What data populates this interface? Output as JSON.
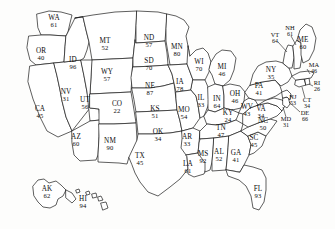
{
  "map": {
    "title": "United States choropleth value map",
    "stroke_color": "#1a1a1a",
    "fill_color": "#ffffff",
    "background_color": "#fdfdfc"
  },
  "chart_data": {
    "type": "map",
    "title": "",
    "xlabel": "",
    "ylabel": "",
    "categories": [
      "WA",
      "OR",
      "CA",
      "NV",
      "ID",
      "MT",
      "WY",
      "UT",
      "AZ",
      "CO",
      "NM",
      "ND",
      "SD",
      "NE",
      "KS",
      "OK",
      "TX",
      "MN",
      "IA",
      "MO",
      "AR",
      "LA",
      "WI",
      "IL",
      "MI",
      "IN",
      "OH",
      "KY",
      "TN",
      "MS",
      "AL",
      "GA",
      "FL",
      "SC",
      "NC",
      "VA",
      "WV",
      "MD",
      "DE",
      "PA",
      "NJ",
      "NY",
      "CT",
      "RI",
      "MA",
      "VT",
      "NH",
      "ME",
      "AK",
      "HI"
    ],
    "values": [
      61,
      40,
      45,
      31,
      96,
      52,
      57,
      56,
      60,
      22,
      90,
      57,
      70,
      87,
      51,
      34,
      45,
      80,
      78,
      54,
      33,
      61,
      70,
      33,
      46,
      64,
      46,
      24,
      47,
      92,
      52,
      41,
      93,
      45,
      50,
      34,
      43,
      31,
      66,
      41,
      53,
      35,
      34,
      26,
      46,
      64,
      61,
      60,
      62,
      94
    ]
  },
  "states": [
    {
      "abbr": "WA",
      "value": "61",
      "x": 54,
      "y": 22,
      "size": "normal"
    },
    {
      "abbr": "OR",
      "value": "40",
      "x": 41,
      "y": 55,
      "size": "normal"
    },
    {
      "abbr": "CA",
      "value": "45",
      "x": 40,
      "y": 113,
      "size": "normal"
    },
    {
      "abbr": "NV",
      "value": "31",
      "x": 66,
      "y": 96,
      "size": "normal"
    },
    {
      "abbr": "ID",
      "value": "96",
      "x": 73,
      "y": 64,
      "size": "normal"
    },
    {
      "abbr": "MT",
      "value": "52",
      "x": 105,
      "y": 45,
      "size": "normal"
    },
    {
      "abbr": "WY",
      "value": "57",
      "x": 107,
      "y": 76,
      "size": "normal"
    },
    {
      "abbr": "UT",
      "value": "56",
      "x": 85,
      "y": 104,
      "size": "normal"
    },
    {
      "abbr": "AZ",
      "value": "60",
      "x": 76,
      "y": 141,
      "size": "normal"
    },
    {
      "abbr": "CO",
      "value": "22",
      "x": 117,
      "y": 108,
      "size": "normal"
    },
    {
      "abbr": "NM",
      "value": "90",
      "x": 110,
      "y": 145,
      "size": "normal"
    },
    {
      "abbr": "ND",
      "value": "57",
      "x": 149,
      "y": 42,
      "size": "normal"
    },
    {
      "abbr": "SD",
      "value": "70",
      "x": 149,
      "y": 65,
      "size": "normal"
    },
    {
      "abbr": "NE",
      "value": "87",
      "x": 150,
      "y": 90,
      "size": "normal"
    },
    {
      "abbr": "KS",
      "value": "51",
      "x": 155,
      "y": 113,
      "size": "normal"
    },
    {
      "abbr": "OK",
      "value": "34",
      "x": 158,
      "y": 136,
      "size": "normal"
    },
    {
      "abbr": "TX",
      "value": "45",
      "x": 140,
      "y": 160,
      "size": "normal"
    },
    {
      "abbr": "MN",
      "value": "80",
      "x": 177,
      "y": 51,
      "size": "normal"
    },
    {
      "abbr": "IA",
      "value": "78",
      "x": 180,
      "y": 86,
      "size": "normal"
    },
    {
      "abbr": "MO",
      "value": "54",
      "x": 184,
      "y": 114,
      "size": "normal"
    },
    {
      "abbr": "AR",
      "value": "33",
      "x": 187,
      "y": 141,
      "size": "normal"
    },
    {
      "abbr": "LA",
      "value": "61",
      "x": 188,
      "y": 168,
      "size": "normal"
    },
    {
      "abbr": "WI",
      "value": "70",
      "x": 199,
      "y": 66,
      "size": "normal"
    },
    {
      "abbr": "IL",
      "value": "33",
      "x": 201,
      "y": 102,
      "size": "normal"
    },
    {
      "abbr": "MI",
      "value": "46",
      "x": 222,
      "y": 71,
      "size": "normal"
    },
    {
      "abbr": "IN",
      "value": "64",
      "x": 217,
      "y": 103,
      "size": "normal"
    },
    {
      "abbr": "OH",
      "value": "46",
      "x": 235,
      "y": 98,
      "size": "normal"
    },
    {
      "abbr": "KY",
      "value": "24",
      "x": 228,
      "y": 117,
      "size": "normal"
    },
    {
      "abbr": "TN",
      "value": "47",
      "x": 221,
      "y": 132,
      "size": "normal"
    },
    {
      "abbr": "MS",
      "value": "92",
      "x": 203,
      "y": 158,
      "size": "normal"
    },
    {
      "abbr": "AL",
      "value": "52",
      "x": 219,
      "y": 156,
      "size": "normal"
    },
    {
      "abbr": "GA",
      "value": "41",
      "x": 236,
      "y": 157,
      "size": "normal"
    },
    {
      "abbr": "FL",
      "value": "93",
      "x": 258,
      "y": 193,
      "size": "normal"
    },
    {
      "abbr": "SC",
      "value": "45",
      "x": 254,
      "y": 142,
      "size": "normal"
    },
    {
      "abbr": "NC",
      "value": "50",
      "x": 263,
      "y": 125,
      "size": "normal"
    },
    {
      "abbr": "VA",
      "value": "34",
      "x": 261,
      "y": 113,
      "size": "normal"
    },
    {
      "abbr": "WV",
      "value": "43",
      "x": 247,
      "y": 111,
      "size": "normal"
    },
    {
      "abbr": "MD",
      "value": "31",
      "x": 286,
      "y": 122,
      "size": "small"
    },
    {
      "abbr": "DE",
      "value": "66",
      "x": 305,
      "y": 116,
      "size": "small"
    },
    {
      "abbr": "PA",
      "value": "41",
      "x": 259,
      "y": 90,
      "size": "normal"
    },
    {
      "abbr": "NJ",
      "value": "53",
      "x": 293,
      "y": 100,
      "size": "small"
    },
    {
      "abbr": "NY",
      "value": "35",
      "x": 271,
      "y": 74,
      "size": "normal"
    },
    {
      "abbr": "CT",
      "value": "34",
      "x": 307,
      "y": 103,
      "size": "small"
    },
    {
      "abbr": "RI",
      "value": "26",
      "x": 317,
      "y": 86,
      "size": "small"
    },
    {
      "abbr": "MA",
      "value": "46",
      "x": 314,
      "y": 68,
      "size": "small"
    },
    {
      "abbr": "VT",
      "value": "64",
      "x": 275,
      "y": 38,
      "size": "small"
    },
    {
      "abbr": "NH",
      "value": "61",
      "x": 290,
      "y": 31,
      "size": "small"
    },
    {
      "abbr": "ME",
      "value": "60",
      "x": 303,
      "y": 44,
      "size": "normal"
    },
    {
      "abbr": "AK",
      "value": "62",
      "x": 47,
      "y": 193,
      "size": "normal"
    },
    {
      "abbr": "HI",
      "value": "94",
      "x": 83,
      "y": 203,
      "size": "normal"
    }
  ]
}
